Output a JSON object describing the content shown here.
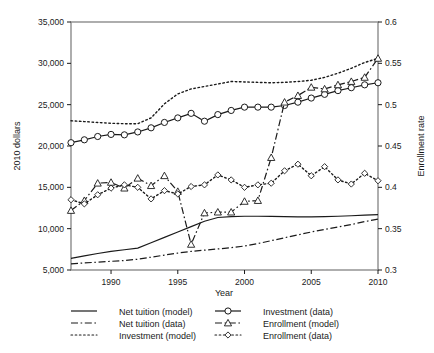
{
  "chart_data": {
    "type": "line",
    "title": "",
    "xlabel": "Year",
    "ylabel": "2010 dollars",
    "y2label": "Enrollment rate",
    "xlim": [
      1987,
      2010
    ],
    "ylim": [
      5000,
      35000
    ],
    "y2lim": [
      0.3,
      0.6
    ],
    "xticks": [
      1990,
      1995,
      2000,
      2005,
      2010
    ],
    "xticklabels": [
      "1990",
      "1995",
      "2000",
      "2005",
      "2010"
    ],
    "yticks": [
      5000,
      10000,
      15000,
      20000,
      25000,
      30000,
      35000
    ],
    "yticklabels": [
      "5,000",
      "10,000",
      "15,000",
      "20,000",
      "25,000",
      "30,000",
      "35,000"
    ],
    "y2ticks": [
      0.3,
      0.35,
      0.4,
      0.45,
      0.5,
      0.55,
      0.6
    ],
    "y2ticklabels": [
      "0.3",
      "0.35",
      "0.4",
      "0.45",
      "0.5",
      "0.55",
      "0.6"
    ],
    "grid": false,
    "legend_position": "below",
    "x": [
      1987,
      1988,
      1989,
      1990,
      1991,
      1992,
      1993,
      1994,
      1995,
      1996,
      1997,
      1998,
      1999,
      2000,
      2001,
      2002,
      2003,
      2004,
      2005,
      2006,
      2007,
      2008,
      2009,
      2010
    ],
    "series": [
      {
        "name": "Net tuition (model)",
        "axis": "left",
        "style": "solid",
        "marker": "none",
        "values": [
          6400,
          6700,
          7000,
          7250,
          7450,
          7650,
          8300,
          8950,
          9600,
          10250,
          10900,
          11350,
          11450,
          11500,
          11500,
          11480,
          11450,
          11430,
          11430,
          11450,
          11500,
          11560,
          11640,
          11700
        ]
      },
      {
        "name": "Net tuition (data)",
        "axis": "left",
        "style": "dashdot",
        "marker": "none",
        "values": [
          5750,
          5850,
          5950,
          6050,
          6150,
          6300,
          6550,
          6800,
          7050,
          7250,
          7400,
          7550,
          7700,
          7900,
          8200,
          8550,
          8900,
          9250,
          9600,
          9900,
          10200,
          10500,
          10850,
          11150
        ]
      },
      {
        "name": "Investment (model)",
        "axis": "left",
        "style": "dotted",
        "marker": "none",
        "values": [
          23050,
          22950,
          22850,
          22750,
          22700,
          22700,
          23400,
          25100,
          26300,
          26900,
          27200,
          27500,
          27800,
          27750,
          27700,
          27650,
          27700,
          27800,
          27950,
          28300,
          28800,
          29400,
          30100,
          30600
        ]
      },
      {
        "name": "Investment (data)",
        "axis": "left",
        "style": "solid",
        "marker": "circle",
        "values": [
          20400,
          20750,
          21150,
          21400,
          21350,
          21700,
          22200,
          22850,
          23400,
          23950,
          23000,
          23800,
          24300,
          24700,
          24700,
          24700,
          24900,
          25300,
          25800,
          26250,
          26700,
          27050,
          27400,
          27650
        ]
      },
      {
        "name": "Enrollment (model)",
        "axis": "right",
        "style": "dashdot",
        "marker": "triangle",
        "values": [
          0.372,
          0.384,
          0.405,
          0.406,
          0.399,
          0.411,
          0.402,
          0.414,
          0.395,
          0.331,
          0.369,
          0.37,
          0.37,
          0.383,
          0.384,
          0.436,
          0.503,
          0.511,
          0.521,
          0.519,
          0.524,
          0.528,
          0.533,
          0.556
        ]
      },
      {
        "name": "Enrollment (data)",
        "axis": "right",
        "style": "dotted",
        "marker": "diamond",
        "values": [
          0.385,
          0.38,
          0.391,
          0.399,
          0.403,
          0.4,
          0.386,
          0.396,
          0.392,
          0.401,
          0.403,
          0.415,
          0.409,
          0.4,
          0.403,
          0.405,
          0.42,
          0.428,
          0.414,
          0.425,
          0.409,
          0.404,
          0.417,
          0.408
        ]
      }
    ]
  },
  "legend": {
    "items": [
      {
        "label": "Net tuition (model)",
        "style": "solid",
        "marker": "none",
        "column": 1
      },
      {
        "label": "Net tuition (data)",
        "style": "dashdot",
        "marker": "none",
        "column": 1
      },
      {
        "label": "Investment (model)",
        "style": "dotted",
        "marker": "none",
        "column": 1
      },
      {
        "label": "Investment (data)",
        "style": "solid",
        "marker": "circle",
        "column": 2
      },
      {
        "label": "Enrollment (model)",
        "style": "dashdot",
        "marker": "triangle",
        "column": 2
      },
      {
        "label": "Enrollment (data)",
        "style": "dotted",
        "marker": "diamond",
        "column": 2
      }
    ]
  },
  "colors": {
    "ink": "#1a1a1a",
    "frame": "#8c8c8c",
    "background": "#ffffff"
  }
}
